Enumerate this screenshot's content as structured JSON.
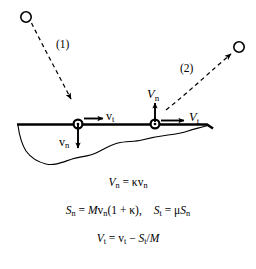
{
  "figure": {
    "background_color": "#ffffff",
    "stroke_color": "#000000",
    "width": 256,
    "height": 269
  },
  "diagram": {
    "path_labels": {
      "incoming": "(1)",
      "outgoing": "(2)"
    },
    "velocity_labels": {
      "incoming_tangential": {
        "symbol": "v",
        "subscript": "t"
      },
      "incoming_normal": {
        "symbol": "v",
        "subscript": "n"
      },
      "outgoing_tangential": {
        "symbol": "V",
        "subscript": "t"
      },
      "outgoing_normal": {
        "symbol": "V",
        "subscript": "n"
      }
    },
    "objects": {
      "incoming_particle": "open-circle",
      "outgoing_particle": "open-circle",
      "impact_point_marker": "circled-dot",
      "rebound_point_marker": "circled-dot",
      "surface": "ground-line",
      "subsurface": "terrain-cross-section"
    }
  },
  "equations": {
    "eq1": {
      "lhs_symbol": "V",
      "lhs_sub": "n",
      "eq": "=",
      "kappa": "κ",
      "rhs_symbol": "v",
      "rhs_sub": "n",
      "plain": "V_n = κv_n"
    },
    "eq2": {
      "part1": {
        "lhs_symbol": "S",
        "lhs_sub": "n",
        "eq": "=",
        "mass": "M",
        "vel_symbol": "v",
        "vel_sub": "n",
        "open": "(1 +",
        "kappa": "κ",
        "close": "),"
      },
      "part2": {
        "lhs_symbol": "S",
        "lhs_sub": "t",
        "eq": "=",
        "mu": "μ",
        "rhs_symbol": "S",
        "rhs_sub": "n"
      },
      "plain": "S_n = Mv_n(1 + κ),   S_t = μS_n"
    },
    "eq3": {
      "lhs_symbol": "V",
      "lhs_sub": "t",
      "eq": "=",
      "rhs_symbol": "v",
      "rhs_sub": "t",
      "minus": "−",
      "imp_symbol": "S",
      "imp_sub": "t",
      "div": "/",
      "mass": "M",
      "plain": "V_t = v_t − S_t/M"
    }
  }
}
